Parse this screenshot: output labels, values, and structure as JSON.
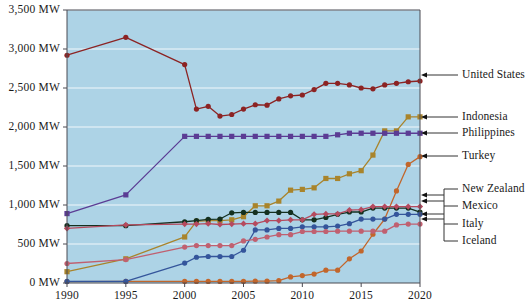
{
  "chart_data": {
    "type": "line",
    "title": "",
    "xlabel": "",
    "ylabel": "",
    "xlim": [
      1990,
      2020
    ],
    "ylim": [
      0,
      3500
    ],
    "grid": true,
    "legend_position": "right",
    "y_ticks": [
      0,
      500,
      1000,
      1500,
      2000,
      2500,
      3000,
      3500
    ],
    "y_tick_labels": [
      "0 MW",
      "500 MW",
      "1,000 MW",
      "1,500 MW",
      "2,000 MW",
      "2,500 MW",
      "3,000 MW",
      "3,500 MW"
    ],
    "x_ticks": [
      1990,
      1995,
      2000,
      2005,
      2010,
      2015,
      2020
    ],
    "x_tick_labels": [
      "1990",
      "1995",
      "2000",
      "2005",
      "2010",
      "2015",
      "2020"
    ],
    "plot_background": "#ADD3E6",
    "gridline_color": "#FFFFFF",
    "series": [
      {
        "name": "United States",
        "color": "#8C2323",
        "marker": "circle",
        "x": [
          1990,
          1995,
          2000,
          2001,
          2002,
          2003,
          2004,
          2005,
          2006,
          2007,
          2008,
          2009,
          2010,
          2011,
          2012,
          2013,
          2014,
          2015,
          2016,
          2017,
          2018,
          2019,
          2020
        ],
        "values": [
          2920,
          3150,
          2800,
          2230,
          2265,
          2140,
          2160,
          2230,
          2285,
          2280,
          2360,
          2400,
          2410,
          2480,
          2560,
          2560,
          2540,
          2500,
          2490,
          2540,
          2560,
          2580,
          2590
        ]
      },
      {
        "name": "Indonesia",
        "color": "#A9842B",
        "marker": "square",
        "x": [
          1990,
          1995,
          2000,
          2001,
          2002,
          2003,
          2004,
          2005,
          2006,
          2007,
          2008,
          2009,
          2010,
          2011,
          2012,
          2013,
          2014,
          2015,
          2016,
          2017,
          2018,
          2019,
          2020
        ],
        "values": [
          145,
          310,
          590,
          790,
          800,
          800,
          810,
          850,
          990,
          990,
          1050,
          1190,
          1200,
          1220,
          1340,
          1340,
          1400,
          1440,
          1640,
          1950,
          1950,
          2130,
          2130
        ]
      },
      {
        "name": "Philippines",
        "color": "#5B3C94",
        "marker": "square",
        "x": [
          1990,
          1995,
          2000,
          2001,
          2002,
          2003,
          2004,
          2005,
          2006,
          2007,
          2008,
          2009,
          2010,
          2011,
          2012,
          2013,
          2014,
          2015,
          2016,
          2017,
          2018,
          2019,
          2020
        ],
        "values": [
          890,
          1130,
          1880,
          1880,
          1880,
          1880,
          1880,
          1880,
          1880,
          1880,
          1880,
          1880,
          1880,
          1880,
          1880,
          1900,
          1920,
          1920,
          1920,
          1920,
          1920,
          1920,
          1920
        ]
      },
      {
        "name": "Turkey",
        "color": "#C2662B",
        "marker": "circle",
        "x": [
          1990,
          1995,
          2000,
          2001,
          2002,
          2003,
          2004,
          2005,
          2006,
          2007,
          2008,
          2009,
          2010,
          2011,
          2012,
          2013,
          2014,
          2015,
          2016,
          2017,
          2018,
          2019,
          2020
        ],
        "values": [
          18,
          20,
          20,
          20,
          20,
          20,
          20,
          20,
          23,
          23,
          30,
          78,
          95,
          115,
          165,
          165,
          310,
          410,
          625,
          820,
          1180,
          1520,
          1620
        ]
      },
      {
        "name": "New Zealand",
        "color": "#14301F",
        "marker": "circle",
        "x": [
          1990,
          1995,
          2000,
          2001,
          2002,
          2003,
          2004,
          2005,
          2006,
          2007,
          2008,
          2009,
          2010,
          2011,
          2012,
          2013,
          2014,
          2015,
          2016,
          2017,
          2018,
          2019,
          2020
        ],
        "values": [
          735,
          735,
          785,
          800,
          815,
          820,
          900,
          905,
          905,
          905,
          905,
          905,
          810,
          810,
          840,
          880,
          910,
          910,
          960,
          960,
          960,
          960,
          910
        ]
      },
      {
        "name": "Mexico",
        "color": "#B54A5E",
        "marker": "diamond",
        "x": [
          1990,
          1995,
          2000,
          2001,
          2002,
          2003,
          2004,
          2005,
          2006,
          2007,
          2008,
          2009,
          2010,
          2011,
          2012,
          2013,
          2014,
          2015,
          2016,
          2017,
          2018,
          2019,
          2020
        ],
        "values": [
          700,
          745,
          755,
          755,
          760,
          750,
          755,
          760,
          760,
          800,
          800,
          810,
          810,
          880,
          885,
          885,
          935,
          940,
          980,
          980,
          980,
          980,
          980
        ]
      },
      {
        "name": "Italy",
        "color": "#34559B",
        "marker": "circle",
        "x": [
          1990,
          1995,
          2000,
          2001,
          2002,
          2003,
          2004,
          2005,
          2006,
          2007,
          2008,
          2009,
          2010,
          2011,
          2012,
          2013,
          2014,
          2015,
          2016,
          2017,
          2018,
          2019,
          2020
        ],
        "values": [
          20,
          20,
          255,
          330,
          340,
          340,
          340,
          420,
          680,
          680,
          700,
          700,
          720,
          720,
          720,
          730,
          760,
          820,
          820,
          820,
          880,
          880,
          880
        ]
      },
      {
        "name": "Iceland",
        "color": "#C06070",
        "marker": "circle",
        "x": [
          1990,
          1995,
          2000,
          2001,
          2002,
          2003,
          2004,
          2005,
          2006,
          2007,
          2008,
          2009,
          2010,
          2011,
          2012,
          2013,
          2014,
          2015,
          2016,
          2017,
          2018,
          2019,
          2020
        ],
        "values": [
          250,
          300,
          460,
          480,
          480,
          480,
          480,
          540,
          560,
          590,
          620,
          620,
          660,
          660,
          660,
          665,
          665,
          665,
          665,
          665,
          745,
          755,
          755
        ]
      }
    ],
    "legend_entries": [
      {
        "label": "United States",
        "color": "#8C2323"
      },
      {
        "label": "Indonesia",
        "color": "#A9842B"
      },
      {
        "label": "Philippines",
        "color": "#5B3C94"
      },
      {
        "label": "Turkey",
        "color": "#C2662B"
      },
      {
        "label": "New Zealand",
        "color": "#14301F"
      },
      {
        "label": "Mexico",
        "color": "#B54A5E"
      },
      {
        "label": "Italy",
        "color": "#34559B"
      },
      {
        "label": "Iceland",
        "color": "#C06070"
      }
    ]
  }
}
